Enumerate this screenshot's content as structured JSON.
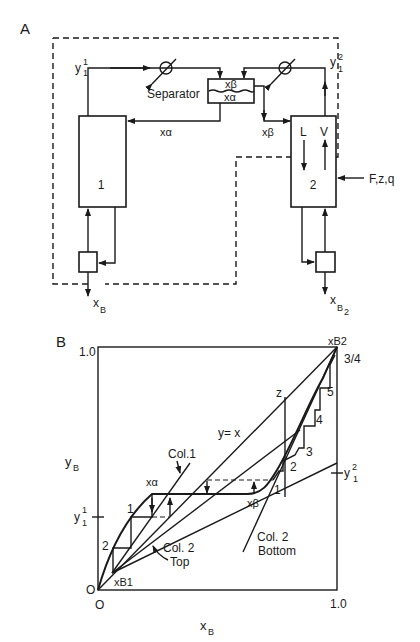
{
  "panel_a": {
    "label": "A",
    "separator_label": "Separator",
    "separator_top": "xβ",
    "separator_bottom": "xα",
    "column1_label": "1",
    "column2_label": "2",
    "col1_vapor": "y",
    "col1_vapor_sup": "1",
    "col1_vapor_sub": "1",
    "col2_vapor": "y",
    "col2_vapor_sup": "2",
    "col2_vapor_sub": "1",
    "x_alpha": "xα",
    "x_beta": "xβ",
    "liquid": "L",
    "vapor": "V",
    "feed": "F,z,q",
    "bottoms1": "x",
    "bottoms1_sub": "B",
    "bottoms1_sub2": "1",
    "bottoms2": "x",
    "bottoms2_sub": "B",
    "bottoms2_sub2": "2"
  },
  "panel_b": {
    "label": "B",
    "y_axis_label": "y",
    "y_axis_sub": "B",
    "x_axis_label": "x",
    "x_axis_sub": "B",
    "y_max": "1.0",
    "x_max": "1.0",
    "origin_y": "O",
    "origin_x": "O",
    "diagonal_label": "y= x",
    "col1_label": "Col.1",
    "col2_top_label": "Col. 2",
    "col2_top_label2": "Top",
    "col2_bottom_label": "Col. 2",
    "col2_bottom_label2": "Bottom",
    "x_alpha": "xα",
    "x_beta": "xβ",
    "z_label": "z",
    "xb1_label": "xB1",
    "xb2_label": "xB2",
    "ratio_label": "3/4",
    "y11_label": "y",
    "y11_sup": "1",
    "y11_sub": "1",
    "y12_label": "y",
    "y12_sup": "2",
    "y12_sub": "1",
    "col1_stages": [
      "1",
      "2"
    ],
    "col2_stages": [
      "1",
      "2",
      "3",
      "4",
      "5"
    ]
  }
}
